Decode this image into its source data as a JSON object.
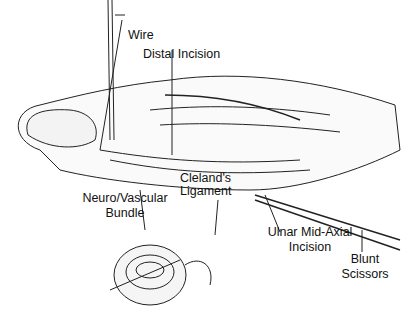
{
  "figure": {
    "labels": {
      "wire": "Wire",
      "distal_incision": "Distal Incision",
      "neurovascular_1": "Neuro/Vascular",
      "neurovascular_2": "Bundle",
      "cleland_1": "Cleland's",
      "cleland_2": "Ligament",
      "ulnar_1": "Ulnar Mid-Axial",
      "ulnar_2": "Incision",
      "scissors_1": "Blunt",
      "scissors_2": "Scissors"
    }
  }
}
